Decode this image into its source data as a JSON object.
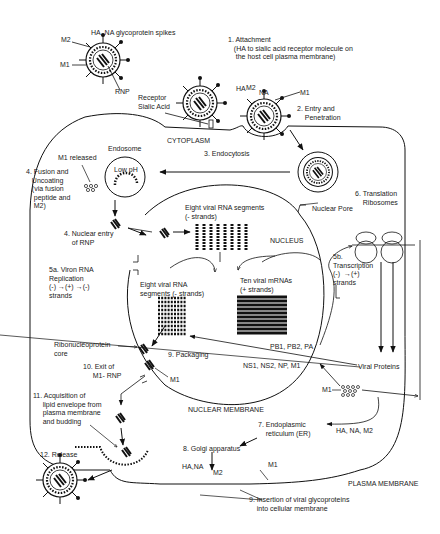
{
  "diagram": {
    "virion_labels": {
      "spikes": "HA, NA glycoprotein spikes",
      "m2": "M2",
      "m1": "M1",
      "rnp": "RNP"
    },
    "receptor": "Receptor\nSialic Acid",
    "compartments": {
      "cytoplasm": "CYTOPLASM",
      "nucleus": "NUCLEUS",
      "nuclear_membrane": "NUCLEAR MEMBRANE",
      "plasma_membrane": "PLASMA MEMBRANE",
      "endosome": "Endosome",
      "low_ph": "Low pH",
      "nuclear_pore": "Nuclear Pore"
    },
    "steps": {
      "s1": "1. Attachment\n   (HA to sialic acid receptor molecule on\n    the host cell plasma membrane)",
      "s2": "2. Entry and\n    Penetration",
      "s2_labels": {
        "ha": "HA",
        "m2": "M2",
        "na": "NA",
        "m1": "M1"
      },
      "s3": "3. Endocytosis",
      "s4a": "4. Fusion and\n   Uncoating\n   (via fusion\n    peptide and\n    M2)",
      "m1_released": "M1 released",
      "s4b": "4. Nuclear entry\n    of RNP",
      "vrna_neg": "Eight viral RNA segments\n(- strands)",
      "s5a": "5a. Viron RNA\nReplication\n(-) →(+) →(-)\nstrands",
      "s5b": "5b.\nTranscription\n(-)  →(+)\nstrands",
      "vrna_neg2": "Eight viral RNA\nsegments (- strands)",
      "mrnas": "Ten viral mRNAs\n(+ strands)",
      "s6": "6. Translation\n    Ribosomes",
      "pb": "PB1, PB2, PA",
      "ns": "NS1, NS2, NP, M1",
      "viral_proteins": "Viral Proteins",
      "m1_cluster": "M1",
      "rnp_core": "Ribonucleoprotein\ncore",
      "s9_pack": "9. Packaging",
      "m1_pack": "M1",
      "s10": "10. Exit of\n     M1- RNP",
      "s11": "11. Acquisition of\n     lipid envelope from\n     plasma membrane\n     and budding",
      "s12": "12. Release",
      "s7": "7. Endoplasmic\n    reticulum (ER)",
      "ha_na_m2": "HA, NA, M2",
      "s8": "8. Golgi apparatus",
      "ha_na": "HA,NA",
      "m2_mem": "M2",
      "m1_mem": "M1",
      "s9_insert": "9. Insertion of viral glycoproteins\n    into cellular membrane"
    }
  }
}
